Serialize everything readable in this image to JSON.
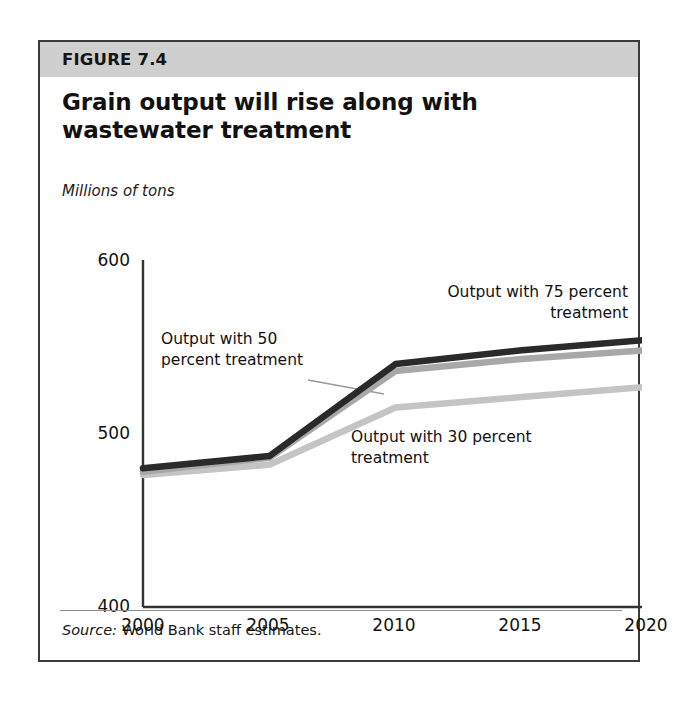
{
  "figure": {
    "band_label": "FIGURE 7.4",
    "title": "Grain output will rise along with wastewater treatment",
    "subtitle": "Millions of tons",
    "source_prefix": "Source:",
    "source_text": "World Bank staff estimates.",
    "colors": {
      "band": "#cfcfcf",
      "frame": "#3b3b3b",
      "series_75": "#2a2a2a",
      "series_50": "#a8a8a8",
      "series_30": "#c4c4c4",
      "axis": "#333333",
      "leader": "#9a9a9a"
    }
  },
  "chart_data": {
    "type": "line",
    "title": "Grain output will rise along with wastewater treatment",
    "subtitle": "Millions of tons",
    "xlabel": "",
    "ylabel": "Millions of tons",
    "x": [
      2000,
      2005,
      2010,
      2015,
      2020
    ],
    "xtick_labels": [
      "2000",
      "2005",
      "2010",
      "2015",
      "2020"
    ],
    "ytick_labels": [
      "600",
      "500",
      "400"
    ],
    "yticks": [
      600,
      500,
      400
    ],
    "xlim": [
      2000,
      2020
    ],
    "ylim": [
      400,
      600
    ],
    "grid": false,
    "legend": "annotations",
    "series": [
      {
        "name": "Output with 75 percent treatment",
        "color": "#2a2a2a",
        "values": [
          480,
          487,
          540,
          548,
          554
        ]
      },
      {
        "name": "Output with 50 percent treatment",
        "color": "#a8a8a8",
        "values": [
          478,
          486,
          536,
          543,
          548
        ]
      },
      {
        "name": "Output with 30 percent treatment",
        "color": "#c4c4c4",
        "values": [
          476,
          482,
          515,
          521,
          527
        ]
      }
    ],
    "annotations": [
      {
        "id": "a75",
        "line1": "Output with 75 percent",
        "line2": "treatment",
        "align": "right"
      },
      {
        "id": "a50",
        "line1": "Output with 50",
        "line2": "percent treatment",
        "align": "left"
      },
      {
        "id": "a30",
        "line1": "Output with 30 percent",
        "line2": "treatment",
        "align": "left"
      }
    ]
  }
}
